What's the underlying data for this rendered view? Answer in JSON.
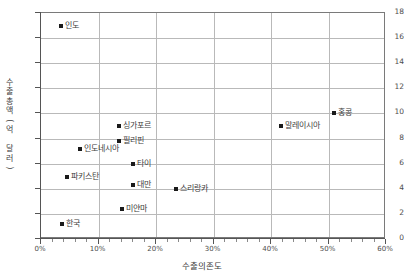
{
  "chart_data": {
    "type": "scatter",
    "title": "",
    "xlabel": "수출의존도",
    "ylabel": "수출총액(억 달러)",
    "xlim": [
      0,
      60
    ],
    "ylim": [
      0,
      18
    ],
    "grid": true,
    "legend": false,
    "x_tick_labels": [
      "0%",
      "10%",
      "20%",
      "30%",
      "40%",
      "50%",
      "60%"
    ],
    "x_tick_values": [
      0,
      10,
      20,
      30,
      40,
      50,
      60
    ],
    "y_tick_labels": [
      "0",
      "2",
      "4",
      "6",
      "8",
      "10",
      "12",
      "14",
      "16",
      "18"
    ],
    "y_tick_values": [
      0,
      2,
      4,
      6,
      8,
      10,
      12,
      14,
      16,
      18
    ],
    "x_unit": "%",
    "points": [
      {
        "label": "인도",
        "x": 3.5,
        "y": 17.0,
        "label_pos": "right"
      },
      {
        "label": "홍콩",
        "x": 51.0,
        "y": 10.0,
        "label_pos": "right"
      },
      {
        "label": "말레이시아",
        "x": 41.8,
        "y": 9.0,
        "label_pos": "right"
      },
      {
        "label": "싱가포르",
        "x": 13.5,
        "y": 9.0,
        "label_pos": "right"
      },
      {
        "label": "필리핀",
        "x": 13.5,
        "y": 7.8,
        "label_pos": "right"
      },
      {
        "label": "인도네시아",
        "x": 6.7,
        "y": 7.2,
        "label_pos": "right"
      },
      {
        "label": "타이",
        "x": 16.0,
        "y": 6.0,
        "label_pos": "right"
      },
      {
        "label": "파키스탄",
        "x": 4.5,
        "y": 4.9,
        "label_pos": "right"
      },
      {
        "label": "대만",
        "x": 16.0,
        "y": 4.3,
        "label_pos": "right"
      },
      {
        "label": "스리랑카",
        "x": 23.5,
        "y": 4.0,
        "label_pos": "right"
      },
      {
        "label": "미얀마",
        "x": 14.0,
        "y": 2.4,
        "label_pos": "right"
      },
      {
        "label": "한국",
        "x": 3.7,
        "y": 1.2,
        "label_pos": "right"
      }
    ],
    "colors": {
      "marker": "#1a1a1a",
      "grid": "#b9b9b9",
      "axis": "#555555",
      "text": "#3d3d3d",
      "background": "#ffffff"
    }
  }
}
